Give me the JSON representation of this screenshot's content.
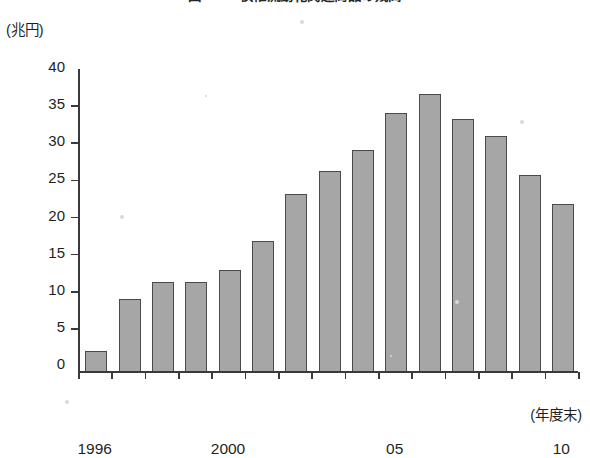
{
  "figure": {
    "title": "図2−1　債権流動化関連商品の残高",
    "y_unit_label": "(兆円)",
    "x_unit_label": "(年度末)"
  },
  "chart_data": {
    "type": "bar",
    "title": "図2−1　債権流動化関連商品の残高",
    "xlabel": "(年度末)",
    "ylabel": "(兆円)",
    "ylim": [
      0,
      40
    ],
    "ytick_labels": [
      "40",
      "35",
      "30",
      "25",
      "20",
      "15",
      "10",
      "5",
      "0"
    ],
    "yticks": [
      40,
      35,
      30,
      25,
      20,
      15,
      10,
      5,
      0
    ],
    "grid": false,
    "legend": null,
    "categories": [
      "1996",
      "1997",
      "1998",
      "1999",
      "2000",
      "2001",
      "2002",
      "2003",
      "2004",
      "05",
      "2006",
      "2007",
      "2008",
      "2009",
      "10"
    ],
    "xtick_labels": [
      {
        "index": 0,
        "text": "1996"
      },
      {
        "index": 4,
        "text": "2000"
      },
      {
        "index": 9,
        "text": "05"
      },
      {
        "index": 14,
        "text": "10"
      }
    ],
    "values": [
      2.8,
      9.8,
      12.0,
      12.0,
      13.7,
      17.6,
      23.9,
      27.0,
      29.8,
      34.8,
      37.3,
      34.0,
      31.7,
      26.5,
      22.5
    ],
    "series": [
      {
        "name": "債権流動化関連商品の残高",
        "values": [
          2.8,
          9.8,
          12.0,
          12.0,
          13.7,
          17.6,
          23.9,
          27.0,
          29.8,
          34.8,
          37.3,
          34.0,
          31.7,
          26.5,
          22.5
        ]
      }
    ]
  },
  "style": {
    "bar_fill": "#a6a6a6",
    "bar_border": "#4a4a4a",
    "axis_color": "#3a3a3a",
    "text_color": "#1f1f1f",
    "background": "#ffffff"
  }
}
